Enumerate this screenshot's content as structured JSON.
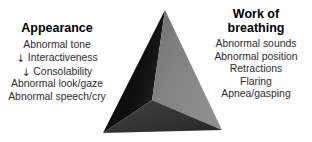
{
  "diagram": {
    "type": "pediatric-assessment-triangle",
    "background_color": "#ffffff",
    "pyramid": {
      "name": "three-sided-pyramid",
      "apex": {
        "x": 165,
        "y": 10
      },
      "base_left": {
        "x": 103,
        "y": 133
      },
      "base_right": {
        "x": 222,
        "y": 130
      },
      "front_vertex": {
        "x": 152,
        "y": 100
      },
      "faces": [
        {
          "name": "left-face",
          "color": "#0a0a0a",
          "gradient_to": "#1c1c1c"
        },
        {
          "name": "right-face",
          "color": "#7e7e7e",
          "gradient_to": "#8c8c8c"
        },
        {
          "name": "front-face",
          "color": "#3a3a3a",
          "gradient_to": "#2c2c2c"
        }
      ]
    },
    "columns": [
      {
        "id": "appearance",
        "heading_lines": [
          "Appearance"
        ],
        "items": [
          {
            "arrow": "",
            "label": "Abnormal tone"
          },
          {
            "arrow": "↓",
            "label": "Interactiveness"
          },
          {
            "arrow": "↓",
            "label": "Consolability"
          },
          {
            "arrow": "",
            "label": "Abnormal look/gaze"
          },
          {
            "arrow": "",
            "label": "Abnormal speech/cry"
          }
        ]
      },
      {
        "id": "work-of-breathing",
        "heading_lines": [
          "Work of",
          "breathing"
        ],
        "items": [
          {
            "arrow": "",
            "label": "Abnormal sounds"
          },
          {
            "arrow": "",
            "label": "Abnormal position"
          },
          {
            "arrow": "",
            "label": "Retractions"
          },
          {
            "arrow": "",
            "label": "Flaring"
          },
          {
            "arrow": "",
            "label": "Apnea/gasping"
          }
        ]
      }
    ]
  }
}
